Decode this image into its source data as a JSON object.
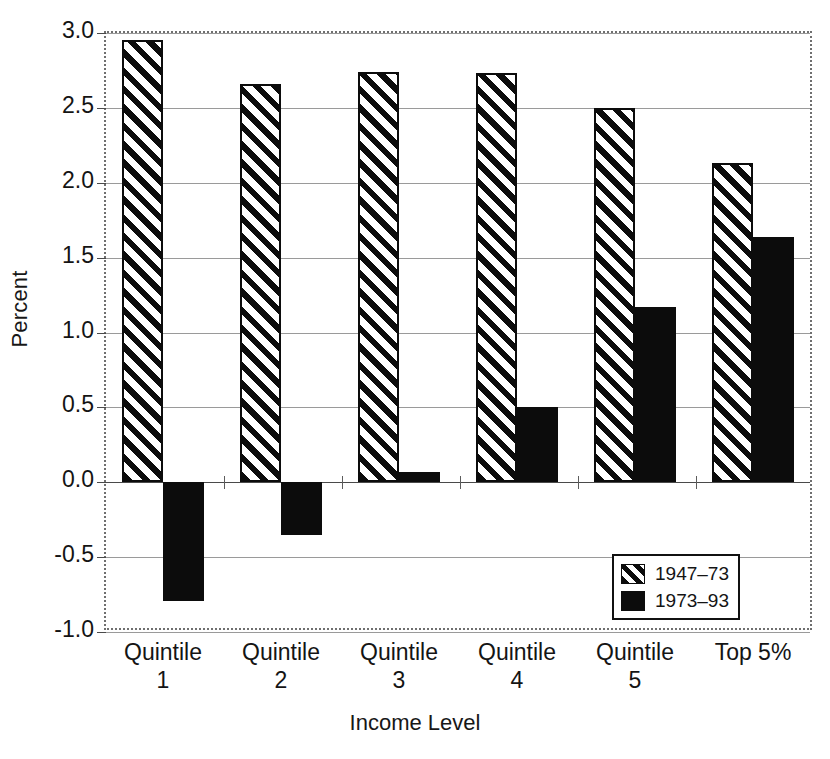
{
  "chart_data": {
    "type": "bar",
    "title": "",
    "xlabel": "Income Level",
    "ylabel": "Percent",
    "categories": [
      "Quintile 1",
      "Quintile 2",
      "Quintile 3",
      "Quintile 4",
      "Quintile 5",
      "Top 5%"
    ],
    "category_lines": [
      [
        "Quintile",
        "1"
      ],
      [
        "Quintile",
        "2"
      ],
      [
        "Quintile",
        "3"
      ],
      [
        "Quintile",
        "4"
      ],
      [
        "Quintile",
        "5"
      ],
      [
        "Top 5%",
        ""
      ]
    ],
    "series": [
      {
        "name": "1947–73",
        "pattern": "diagonal-hatch",
        "color": "#0c0c0c",
        "values": [
          2.95,
          2.66,
          2.74,
          2.73,
          2.5,
          2.13
        ]
      },
      {
        "name": "1973–93",
        "pattern": "solid",
        "color": "#0c0c0c",
        "values": [
          -0.79,
          -0.35,
          0.07,
          0.5,
          1.17,
          1.64
        ]
      }
    ],
    "ylim": [
      -1.0,
      3.0
    ],
    "yticks": [
      3.0,
      2.5,
      2.0,
      1.5,
      1.0,
      0.5,
      0.0,
      -0.5,
      -1.0
    ],
    "ytick_labels": [
      "3.0",
      "2.5",
      "2.0",
      "1.5",
      "1.0",
      "0.5",
      "0.0",
      "-0.5",
      "-1.0"
    ],
    "grid": true,
    "grid_axis": "y",
    "legend_position": "bottom-right",
    "zero_line": 0.0
  },
  "legend": {
    "entries": [
      {
        "label": "1947–73",
        "swatch": "hatched"
      },
      {
        "label": "1973–93",
        "swatch": "solid"
      }
    ]
  },
  "axes": {
    "y_title": "Percent",
    "x_title": "Income Level"
  }
}
